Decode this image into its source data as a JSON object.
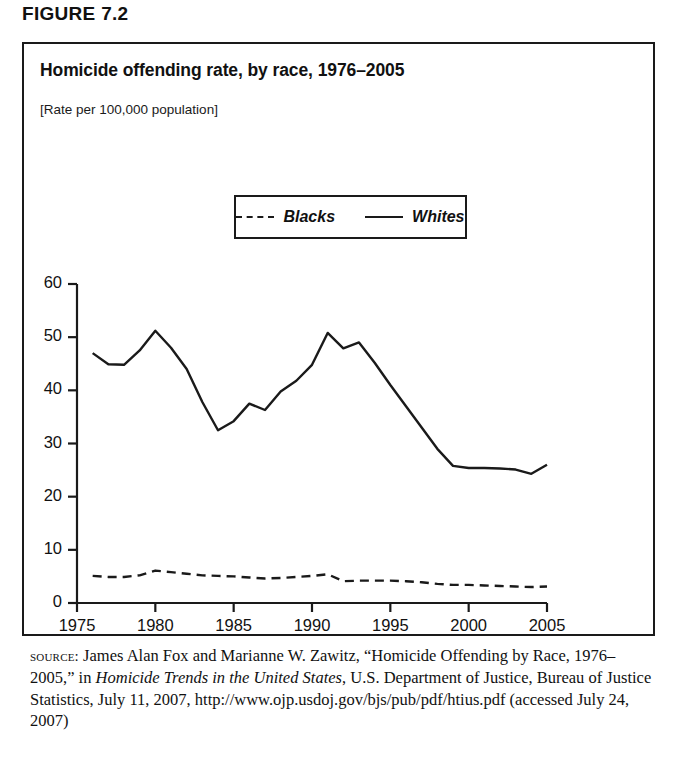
{
  "figure": {
    "label": "FIGURE 7.2",
    "title": "Homicide offending rate, by race, 1976–2005",
    "subtitle": "[Rate per 100,000 population]"
  },
  "legend": {
    "entries": [
      {
        "label": "Blacks",
        "style": "dashed"
      },
      {
        "label": "Whites",
        "style": "solid"
      }
    ]
  },
  "source": {
    "prefix": "source:",
    "line1": " James Alan Fox and Marianne W. Zawitz, “Homicide",
    "line2": "Offending by Race, 1976–2005,” in ",
    "italic1": "Homicide Trends in the United",
    "italic2": "States",
    "line3": ", U.S. Department of Justice, Bureau of Justice Statistics, July 11,",
    "line4": "2007, http://www.ojp.usdoj.gov/bjs/pub/pdf/htius.pdf (accessed July",
    "line5": "24, 2007)"
  },
  "chart_data": {
    "type": "line",
    "title": "Homicide offending rate, by race, 1976–2005",
    "subtitle": "[Rate per 100,000 population]",
    "xlabel": "",
    "ylabel": "Rate per 100,000 population",
    "xlim": [
      1975,
      2005
    ],
    "ylim": [
      0,
      60
    ],
    "xticks": [
      1975,
      1980,
      1985,
      1990,
      1995,
      2000,
      2005
    ],
    "yticks": [
      0,
      10,
      20,
      30,
      40,
      50,
      60
    ],
    "grid": false,
    "legend_position": "upper-center",
    "x": [
      1976,
      1977,
      1978,
      1979,
      1980,
      1981,
      1982,
      1983,
      1984,
      1985,
      1986,
      1987,
      1988,
      1989,
      1990,
      1991,
      1992,
      1993,
      1994,
      1995,
      1996,
      1997,
      1998,
      1999,
      2000,
      2001,
      2002,
      2003,
      2004,
      2005
    ],
    "series": [
      {
        "name": "Blacks",
        "style": "dashed",
        "color": "#1a1a1a",
        "values": [
          5.1,
          4.9,
          4.9,
          5.2,
          6.1,
          5.8,
          5.5,
          5.2,
          5.1,
          5.0,
          4.8,
          4.6,
          4.7,
          4.9,
          5.1,
          5.4,
          4.1,
          4.2,
          4.2,
          4.2,
          4.1,
          3.9,
          3.6,
          3.4,
          3.4,
          3.3,
          3.2,
          3.1,
          3.0,
          3.1
        ]
      },
      {
        "name": "Whites",
        "style": "solid",
        "color": "#1a1a1a",
        "values": [
          47.0,
          44.9,
          44.8,
          47.5,
          51.2,
          48.0,
          44.0,
          37.8,
          32.5,
          34.2,
          37.5,
          36.3,
          39.8,
          41.8,
          44.8,
          50.8,
          47.9,
          49.0,
          45.2,
          41.0,
          37.0,
          33.0,
          29.0,
          25.8,
          25.4,
          25.4,
          25.3,
          25.1,
          24.3,
          26.0
        ]
      }
    ]
  }
}
